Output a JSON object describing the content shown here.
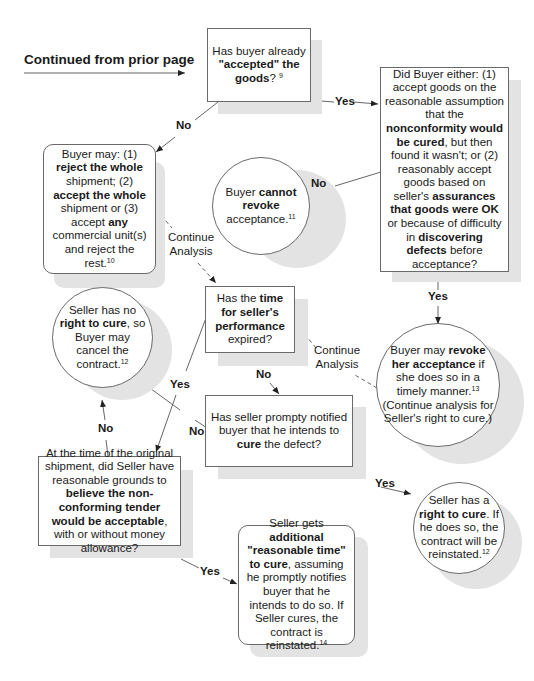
{
  "entry": {
    "heading": "Continued from prior page"
  },
  "nodes": {
    "accepted_goods": {
      "shape": "rectangle",
      "parts": [
        {
          "t": "Has buyer already "
        },
        {
          "t": "\"accepted\" the goods",
          "b": true
        },
        {
          "t": "? "
        },
        {
          "t": "9",
          "sup": true
        }
      ]
    },
    "did_buyer_either": {
      "shape": "rectangle",
      "parts": [
        {
          "t": "Did Buyer either: (1) accept goods on the reasonable assumption that the "
        },
        {
          "t": "nonconformity would be cured",
          "b": true
        },
        {
          "t": ", but then found it wasn't; or (2) reasonably accept goods based on seller's "
        },
        {
          "t": "assurances that goods were OK",
          "b": true
        },
        {
          "t": " or because of difficulty in "
        },
        {
          "t": "discovering defects",
          "b": true
        },
        {
          "t": " before acceptance?"
        }
      ]
    },
    "buyer_may_reject": {
      "shape": "rounded-rectangle",
      "parts": [
        {
          "t": "Buyer may: (1) "
        },
        {
          "t": "reject the whole",
          "b": true
        },
        {
          "t": " shipment; (2) "
        },
        {
          "t": "accept the whole",
          "b": true
        },
        {
          "t": " shipment or (3) accept "
        },
        {
          "t": "any",
          "b": true
        },
        {
          "t": " commercial unit(s) and reject the rest."
        },
        {
          "t": "10",
          "sup": true
        }
      ]
    },
    "cannot_revoke": {
      "shape": "circle",
      "parts": [
        {
          "t": "Buyer "
        },
        {
          "t": "cannot revoke",
          "b": true
        },
        {
          "t": " acceptance."
        },
        {
          "t": "11",
          "sup": true
        }
      ]
    },
    "time_expired": {
      "shape": "rectangle",
      "parts": [
        {
          "t": "Has the "
        },
        {
          "t": "time for seller's performance",
          "b": true
        },
        {
          "t": " expired?"
        }
      ]
    },
    "may_revoke": {
      "shape": "circle",
      "parts": [
        {
          "t": "Buyer may "
        },
        {
          "t": "revoke her acceptance",
          "b": true
        },
        {
          "t": " if she does so in a timely manner."
        },
        {
          "t": "13",
          "sup": true
        },
        {
          "t": " (Continue analysis for Seller's right to cure.)"
        }
      ]
    },
    "no_right_to_cure": {
      "shape": "circle",
      "parts": [
        {
          "t": "Seller has no "
        },
        {
          "t": "right to cure",
          "b": true
        },
        {
          "t": ", so Buyer may cancel the contract."
        },
        {
          "t": "12",
          "sup": true
        }
      ]
    },
    "notified_buyer": {
      "shape": "rectangle",
      "parts": [
        {
          "t": "Has seller prompty notified buyer that he intends to "
        },
        {
          "t": "cure",
          "b": true
        },
        {
          "t": " the defect?"
        }
      ]
    },
    "original_shipment": {
      "shape": "rectangle",
      "parts": [
        {
          "t": "At the time of the original shipment, did Seller have reasonable grounds to "
        },
        {
          "t": "believe the non-conforming tender would be acceptable",
          "b": true
        },
        {
          "t": ", with or without money allowance?"
        }
      ]
    },
    "right_to_cure": {
      "shape": "circle",
      "parts": [
        {
          "t": "Seller has a "
        },
        {
          "t": "right to cure",
          "b": true
        },
        {
          "t": ". If he does so, the contract will be reinstated."
        },
        {
          "t": "12",
          "sup": true
        }
      ]
    },
    "additional_time": {
      "shape": "rounded-rectangle",
      "parts": [
        {
          "t": "Seller gets "
        },
        {
          "t": "additional \"reasonable time\" to cure",
          "b": true
        },
        {
          "t": ", assuming he promptly notifies buyer that he intends to do so. If Seller cures, the contract is reinstated."
        },
        {
          "t": "14",
          "sup": true
        }
      ]
    }
  },
  "edge_labels": {
    "accepted_no": "No",
    "accepted_yes": "Yes",
    "did_buyer_no": "No",
    "did_buyer_yes": "Yes",
    "continue_1_line1": "Continue",
    "continue_1_line2": "Analysis",
    "continue_2_line1": "Continue",
    "continue_2_line2": "Analysis",
    "time_yes": "Yes",
    "time_no": "No",
    "notified_no": "No",
    "notified_yes": "Yes",
    "original_no": "No",
    "original_yes": "Yes"
  },
  "colors": {
    "border": "#6a6a6a",
    "shadow": "#e3e3e3",
    "line": "#555555",
    "text": "#1a1a1a"
  }
}
